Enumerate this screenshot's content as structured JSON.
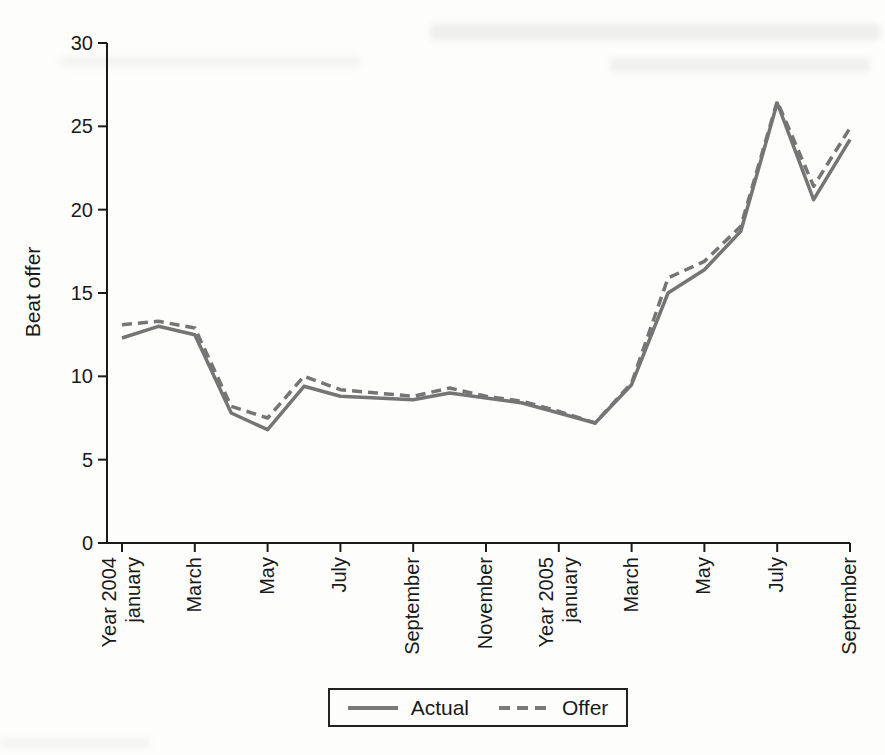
{
  "figure": {
    "background_color": "#fdfdfc"
  },
  "chart_data": {
    "type": "line",
    "title": "",
    "xlabel": "",
    "ylabel": "Beat offer",
    "ylim": [
      0,
      30
    ],
    "yticks": [
      0,
      5,
      10,
      15,
      20,
      25,
      30
    ],
    "grid": false,
    "legend_position": "bottom-center",
    "line_color": "#757575",
    "axis_color": "#1a1a1a",
    "categories": [
      "Jan 2004",
      "Feb 2004",
      "Mar 2004",
      "Apr 2004",
      "May 2004",
      "Jun 2004",
      "Jul 2004",
      "Aug 2004",
      "Sep 2004",
      "Oct 2004",
      "Nov 2004",
      "Dec 2004",
      "Jan 2005",
      "Feb 2005",
      "Mar 2005",
      "Apr 2005",
      "May 2005",
      "Jun 2005",
      "Jul 2005",
      "Aug 2005",
      "Sep 2005"
    ],
    "x_tick_labels": [
      {
        "month_index": 0,
        "label": "Year 2004\njanuary"
      },
      {
        "month_index": 2,
        "label": "March"
      },
      {
        "month_index": 4,
        "label": "May"
      },
      {
        "month_index": 6,
        "label": "July"
      },
      {
        "month_index": 8,
        "label": "September"
      },
      {
        "month_index": 10,
        "label": "November"
      },
      {
        "month_index": 12,
        "label": "Year 2005\njanuary"
      },
      {
        "month_index": 14,
        "label": "March"
      },
      {
        "month_index": 16,
        "label": "May"
      },
      {
        "month_index": 18,
        "label": "July"
      },
      {
        "month_index": 20,
        "label": "September"
      }
    ],
    "series": [
      {
        "name": "Actual",
        "line_style": "solid",
        "values": [
          12.3,
          13.0,
          12.5,
          7.8,
          6.8,
          9.4,
          8.8,
          8.7,
          8.6,
          9.0,
          8.7,
          8.4,
          7.8,
          7.2,
          9.5,
          15.0,
          16.4,
          18.7,
          26.4,
          20.6,
          24.2
        ]
      },
      {
        "name": "Offer",
        "line_style": "dashed",
        "values": [
          13.1,
          13.3,
          12.9,
          8.2,
          7.5,
          10.0,
          9.2,
          9.0,
          8.8,
          9.3,
          8.8,
          8.5,
          7.9,
          7.2,
          9.6,
          15.9,
          16.9,
          19.0,
          26.5,
          21.4,
          24.9
        ]
      }
    ]
  }
}
